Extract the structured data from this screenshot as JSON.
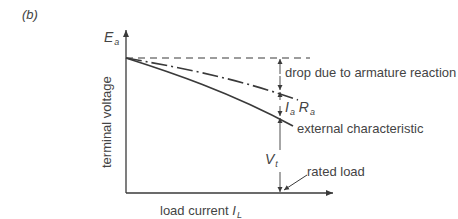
{
  "figure": {
    "panel_label": "(b)",
    "y_axis": {
      "top_label": "E",
      "top_label_sub": "a",
      "label": "terminal voltage"
    },
    "x_axis": {
      "label": "load current ",
      "label_symbol": "I",
      "label_sub": "L"
    },
    "curves": [
      {
        "name": "no-load reference",
        "style": "dashed",
        "description": "E_a level"
      },
      {
        "name": "after armature reaction",
        "style": "dash-dot"
      },
      {
        "name": "external characteristic",
        "style": "solid"
      }
    ],
    "annotations": {
      "drop": "drop due to armature reaction",
      "iara_symbol_1": "I",
      "iara_sub_1": "a",
      "iara_symbol_2": "R",
      "iara_sub_2": "a",
      "external": "external characteristic",
      "vt_symbol": "V",
      "vt_sub": "t",
      "rated": "rated load"
    },
    "colors": {
      "line": "#3a3a3a",
      "text": "#444444",
      "background": "#ffffff"
    }
  }
}
